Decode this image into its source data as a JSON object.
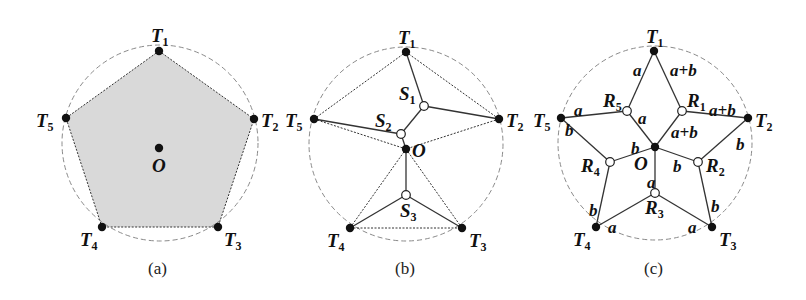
{
  "figure": {
    "panels": [
      {
        "id": "a",
        "caption": "(a)",
        "description": "Regular pentagon of terminals T1..T5 inscribed in a dashed circle with center O; interior shaded",
        "fill_color": "#d9d9d9",
        "terminals": [
          {
            "name": "T",
            "sub": "1",
            "x": 159,
            "y": 51,
            "lx": 151,
            "ly": 42
          },
          {
            "name": "T",
            "sub": "2",
            "x": 254,
            "y": 119,
            "lx": 261,
            "ly": 127
          },
          {
            "name": "T",
            "sub": "3",
            "x": 218,
            "y": 227,
            "lx": 224,
            "ly": 246
          },
          {
            "name": "T",
            "sub": "4",
            "x": 102,
            "y": 227,
            "lx": 80,
            "ly": 246
          },
          {
            "name": "T",
            "sub": "5",
            "x": 66,
            "y": 118,
            "lx": 36,
            "ly": 127
          }
        ],
        "center": {
          "name": "O",
          "x": 159,
          "y": 148,
          "lx": 152,
          "ly": 172
        }
      },
      {
        "id": "b",
        "caption": "(b)",
        "description": "Steiner tree with Steiner points S1, S2, S3 connecting terminals; dotted triangulation edges to O",
        "terminals": [
          {
            "name": "T",
            "sub": "1",
            "x": 406,
            "y": 52,
            "lx": 398,
            "ly": 44
          },
          {
            "name": "T",
            "sub": "2",
            "x": 499,
            "y": 119,
            "lx": 506,
            "ly": 127
          },
          {
            "name": "T",
            "sub": "3",
            "x": 462,
            "y": 228,
            "lx": 469,
            "ly": 247
          },
          {
            "name": "T",
            "sub": "4",
            "x": 350,
            "y": 228,
            "lx": 327,
            "ly": 247
          },
          {
            "name": "T",
            "sub": "5",
            "x": 314,
            "y": 119,
            "lx": 285,
            "ly": 127
          }
        ],
        "center": {
          "name": "O",
          "x": 406,
          "y": 149,
          "lx": 412,
          "ly": 157
        },
        "steiner_points": [
          {
            "name": "S",
            "sub": "1",
            "x": 424,
            "y": 106,
            "lx": 399,
            "ly": 100
          },
          {
            "name": "S",
            "sub": "2",
            "x": 401,
            "y": 134,
            "lx": 375,
            "ly": 127
          },
          {
            "name": "S",
            "sub": "3",
            "x": 406,
            "y": 195,
            "lx": 400,
            "ly": 217
          }
        ]
      },
      {
        "id": "c",
        "caption": "(c)",
        "description": "Star-shaped tree with points R1..R5; edges labeled with lengths a, b, a+b",
        "terminals": [
          {
            "name": "T",
            "sub": "1",
            "x": 654,
            "y": 51,
            "lx": 646,
            "ly": 43
          },
          {
            "name": "T",
            "sub": "2",
            "x": 748,
            "y": 118,
            "lx": 755,
            "ly": 127
          },
          {
            "name": "T",
            "sub": "3",
            "x": 712,
            "y": 227,
            "lx": 719,
            "ly": 246
          },
          {
            "name": "T",
            "sub": "4",
            "x": 596,
            "y": 227,
            "lx": 573,
            "ly": 246
          },
          {
            "name": "T",
            "sub": "5",
            "x": 561,
            "y": 118,
            "lx": 533,
            "ly": 127
          }
        ],
        "center": {
          "name": "O",
          "x": 655,
          "y": 147,
          "lx": 634,
          "ly": 170
        },
        "relay_points": [
          {
            "name": "R",
            "sub": "1",
            "x": 682,
            "y": 111,
            "lx": 687,
            "ly": 107
          },
          {
            "name": "R",
            "sub": "2",
            "x": 698,
            "y": 162,
            "lx": 706,
            "ly": 172
          },
          {
            "name": "R",
            "sub": "3",
            "x": 655,
            "y": 193,
            "lx": 645,
            "ly": 214
          },
          {
            "name": "R",
            "sub": "4",
            "x": 610,
            "y": 162,
            "lx": 581,
            "ly": 172
          },
          {
            "name": "R",
            "sub": "5",
            "x": 627,
            "y": 111,
            "lx": 603,
            "ly": 107
          }
        ],
        "edge_labels": [
          {
            "text": "a",
            "x": 633,
            "y": 76
          },
          {
            "text": "a+b",
            "x": 670,
            "y": 76
          },
          {
            "text": "a",
            "x": 574,
            "y": 116
          },
          {
            "text": "a+b",
            "x": 709,
            "y": 116
          },
          {
            "text": "a",
            "x": 638,
            "y": 124
          },
          {
            "text": "a+b",
            "x": 671,
            "y": 138
          },
          {
            "text": "b",
            "x": 565,
            "y": 136
          },
          {
            "text": "b",
            "x": 736,
            "y": 150
          },
          {
            "text": "b",
            "x": 631,
            "y": 154
          },
          {
            "text": "b",
            "x": 673,
            "y": 172
          },
          {
            "text": "a",
            "x": 647,
            "y": 188
          },
          {
            "text": "b",
            "x": 589,
            "y": 216
          },
          {
            "text": "b",
            "x": 711,
            "y": 212
          },
          {
            "text": "a",
            "x": 608,
            "y": 233
          },
          {
            "text": "a",
            "x": 688,
            "y": 233
          }
        ]
      }
    ],
    "colors": {
      "dashed_circle": "#8a8a8a",
      "edge": "#333333",
      "node_fill": "#111111",
      "hollow_node_fill": "#ffffff"
    }
  }
}
